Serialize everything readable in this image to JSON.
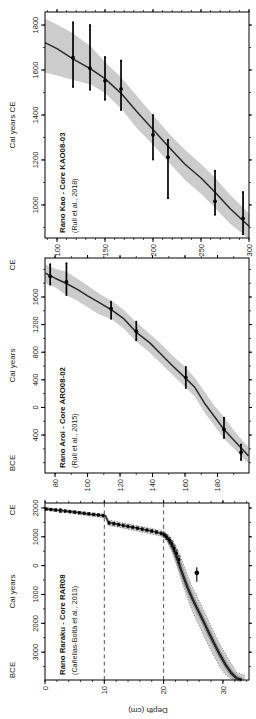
{
  "figure": {
    "depth_axis_label": "Depth (cm)",
    "background": "#ffffff",
    "text_color": "#1a1a1a",
    "frame_color": "#000000",
    "band_color": "#cccccc",
    "curve_color": "#2b2b2b",
    "fan_color": "#8c8c8c"
  },
  "chart_data": [
    {
      "id": "raraku",
      "type": "line",
      "title": "Rano Raraku - Core RAR08",
      "citation": "(Cañellas-Boltà et al., 2013)",
      "axis_title": "Cal years",
      "era_left": "BCE",
      "era_right": "CE",
      "age_range": [
        -3966,
        2172
      ],
      "age_ticks": {
        "values": [
          2000,
          1000,
          0,
          -1000,
          -2000,
          -3000
        ],
        "labels": [
          "2000",
          "1000",
          "0",
          "1000",
          "2000",
          "3000"
        ],
        "minor_step": 500
      },
      "depth_range": [
        0,
        34.4
      ],
      "depth_ticks": {
        "values": [
          0,
          10,
          20,
          30
        ],
        "labels": [
          "0",
          "10",
          "20",
          "30"
        ],
        "minor_step": 2
      },
      "dashed_depths": [
        10,
        20
      ],
      "marker": "square",
      "band_outline": "dotted",
      "band": [
        [
          0,
          1918,
          2012
        ],
        [
          2,
          1872,
          1972
        ],
        [
          4,
          1822,
          1925
        ],
        [
          6,
          1768,
          1876
        ],
        [
          8,
          1710,
          1826
        ],
        [
          10.2,
          1652,
          1782
        ],
        [
          10.7,
          1385,
          1585
        ],
        [
          12,
          1345,
          1532
        ],
        [
          14,
          1262,
          1448
        ],
        [
          16,
          1178,
          1368
        ],
        [
          18,
          1088,
          1286
        ],
        [
          19.9,
          1008,
          1192
        ],
        [
          20.5,
          872,
          1112
        ],
        [
          21,
          682,
          1022
        ],
        [
          21.5,
          452,
          882
        ],
        [
          22,
          152,
          702
        ],
        [
          22.5,
          -178,
          482
        ],
        [
          23,
          -518,
          232
        ],
        [
          23.5,
          -838,
          -38
        ],
        [
          24,
          -1128,
          -328
        ],
        [
          24.7,
          -1508,
          -678
        ],
        [
          25.5,
          -1868,
          -1018
        ],
        [
          26.4,
          -2268,
          -1398
        ],
        [
          27.4,
          -2698,
          -1838
        ],
        [
          28.4,
          -3098,
          -2278
        ],
        [
          29.4,
          -3478,
          -2678
        ],
        [
          30.4,
          -3778,
          -3048
        ],
        [
          31.4,
          -3938,
          -3398
        ],
        [
          32.3,
          -3966,
          -3698
        ],
        [
          33.6,
          -3966,
          -3790
        ]
      ],
      "curve": [
        [
          0,
          1970
        ],
        [
          1,
          1950
        ],
        [
          2,
          1928
        ],
        [
          3,
          1905
        ],
        [
          4,
          1880
        ],
        [
          5,
          1855
        ],
        [
          6,
          1828
        ],
        [
          7,
          1800
        ],
        [
          8,
          1775
        ],
        [
          9,
          1752
        ],
        [
          10.2,
          1726
        ],
        [
          10.7,
          1492
        ],
        [
          12,
          1442
        ],
        [
          13,
          1400
        ],
        [
          14,
          1360
        ],
        [
          15,
          1320
        ],
        [
          16,
          1280
        ],
        [
          17,
          1240
        ],
        [
          18,
          1196
        ],
        [
          19,
          1150
        ],
        [
          19.9,
          1100
        ],
        [
          20.5,
          1002
        ],
        [
          21,
          852
        ],
        [
          21.5,
          652
        ],
        [
          22,
          402
        ],
        [
          22.5,
          122
        ],
        [
          23,
          -178
        ],
        [
          23.5,
          -468
        ],
        [
          24,
          -738
        ],
        [
          24.7,
          -1078
        ],
        [
          25.5,
          -1420
        ],
        [
          26.4,
          -1800
        ],
        [
          27.4,
          -2230
        ],
        [
          28.4,
          -2650
        ],
        [
          29.4,
          -3050
        ],
        [
          30.4,
          -3420
        ],
        [
          31.4,
          -3720
        ],
        [
          32.3,
          -3900
        ],
        [
          33.2,
          -3960
        ]
      ],
      "dates": [
        [
          0.2,
          1963,
          1920,
          2005
        ],
        [
          1,
          1946,
          1903,
          1988
        ],
        [
          1.8,
          1928,
          1885,
          1970
        ],
        [
          2.6,
          1910,
          1840,
          1975
        ],
        [
          3.4,
          1892,
          1849,
          1934
        ],
        [
          4.2,
          1874,
          1830,
          1916
        ],
        [
          5,
          1855,
          1812,
          1898
        ],
        [
          5.8,
          1836,
          1792,
          1878
        ],
        [
          6.6,
          1816,
          1772,
          1858
        ],
        [
          7.4,
          1796,
          1752,
          1838
        ],
        [
          8.2,
          1776,
          1732,
          1818
        ],
        [
          9,
          1756,
          1712,
          1798
        ],
        [
          9.8,
          1736,
          1690,
          1780
        ],
        [
          10.8,
          1482,
          1432,
          1530
        ],
        [
          11.6,
          1452,
          1402,
          1500
        ],
        [
          12.4,
          1422,
          1372,
          1470
        ],
        [
          13.2,
          1392,
          1342,
          1440
        ],
        [
          14,
          1362,
          1312,
          1410
        ],
        [
          14.8,
          1330,
          1280,
          1378
        ],
        [
          15.6,
          1298,
          1248,
          1346
        ],
        [
          16.4,
          1266,
          1216,
          1314
        ],
        [
          17.2,
          1232,
          1182,
          1280
        ],
        [
          18,
          1198,
          1148,
          1246
        ],
        [
          18.8,
          1162,
          1110,
          1212
        ],
        [
          19.6,
          1118,
          1064,
          1170
        ],
        [
          20.1,
          1062,
          990,
          1130
        ],
        [
          20.5,
          988,
          905,
          1065
        ],
        [
          21,
          880,
          788,
          968
        ],
        [
          21.4,
          760,
          658,
          858
        ],
        [
          21.8,
          602,
          490,
          710
        ],
        [
          22.2,
          422,
          298,
          540
        ],
        [
          22.6,
          212,
          78,
          340
        ]
      ],
      "outliers": [
        [
          25.6,
          -250,
          -560,
          -60
        ]
      ],
      "fan_from_depth": 19.9
    },
    {
      "id": "aroi",
      "type": "line",
      "title": "Rano Aroi - Core ARO08-02",
      "citation": "(Rull et al., 2015)",
      "axis_title": "Cal years",
      "era_left": "BCE",
      "era_right": "CE",
      "age_range": [
        -950,
        2165
      ],
      "age_ticks": {
        "values": [
          1600,
          1200,
          800,
          400,
          0,
          -400
        ],
        "labels": [
          "1600",
          "1200",
          "800",
          "400",
          "0",
          "400"
        ],
        "minor_step": 200
      },
      "depth_range": [
        73.8,
        199.4
      ],
      "depth_ticks": {
        "values": [
          80,
          100,
          120,
          140,
          160,
          180
        ],
        "labels": [
          "80",
          "100",
          "120",
          "140",
          "160",
          "180"
        ],
        "minor_step": 10
      },
      "dashed_depths": [],
      "marker": "bar",
      "band_outline": "none",
      "band": [
        [
          74,
          1800,
          2075
        ],
        [
          80,
          1740,
          2010
        ],
        [
          87,
          1625,
          1965
        ],
        [
          94,
          1540,
          1860
        ],
        [
          100,
          1450,
          1765
        ],
        [
          107,
          1350,
          1650
        ],
        [
          115,
          1272,
          1540
        ],
        [
          122,
          1150,
          1420
        ],
        [
          130,
          955,
          1235
        ],
        [
          138,
          800,
          1070
        ],
        [
          145,
          645,
          925
        ],
        [
          152,
          480,
          760
        ],
        [
          160,
          300,
          590
        ],
        [
          166,
          160,
          430
        ],
        [
          172,
          -75,
          230
        ],
        [
          178,
          -260,
          30
        ],
        [
          184,
          -450,
          -140
        ],
        [
          190,
          -590,
          -330
        ],
        [
          196,
          -745,
          -498
        ],
        [
          199,
          -810,
          -570
        ]
      ],
      "curve": [
        [
          74,
          1945
        ],
        [
          80,
          1872
        ],
        [
          87,
          1795
        ],
        [
          94,
          1705
        ],
        [
          100,
          1618
        ],
        [
          107,
          1522
        ],
        [
          115,
          1408
        ],
        [
          122,
          1292
        ],
        [
          130,
          1088
        ],
        [
          138,
          942
        ],
        [
          145,
          778
        ],
        [
          152,
          612
        ],
        [
          160,
          432
        ],
        [
          166,
          292
        ],
        [
          172,
          62
        ],
        [
          178,
          -128
        ],
        [
          184,
          -320
        ],
        [
          190,
          -472
        ],
        [
          196,
          -622
        ],
        [
          199,
          -700
        ]
      ],
      "dates": [
        [
          77,
          1900,
          1780,
          2075
        ],
        [
          87,
          1820,
          1630,
          2090
        ],
        [
          114.5,
          1430,
          1285,
          1532
        ],
        [
          130,
          1105,
          972,
          1240
        ],
        [
          160.5,
          435,
          282,
          585
        ],
        [
          184,
          -320,
          -442,
          -148
        ],
        [
          194.5,
          -650,
          -762,
          -538
        ]
      ],
      "outliers": []
    },
    {
      "id": "kao",
      "type": "line",
      "title": "Rano Kao - Core KAO08-03",
      "citation": "(Rull et al., 2018)",
      "axis_title": "Cal years CE",
      "era_left": "",
      "era_right": "",
      "age_range": [
        853,
        1858
      ],
      "age_ticks": {
        "values": [
          1000,
          1200,
          1400,
          1600,
          1800
        ],
        "labels": [
          "1000",
          "1200",
          "1400",
          "1600",
          "1800"
        ],
        "minor_step": 100
      },
      "depth_range": [
        87.5,
        300
      ],
      "depth_ticks": {
        "values": [
          100,
          150,
          200,
          250,
          300
        ],
        "labels": [
          "100",
          "150",
          "200",
          "250",
          "300"
        ],
        "minor_step": 10
      },
      "dashed_depths": [],
      "marker": "bar",
      "band_outline": "none",
      "band": [
        [
          87.5,
          1588,
          1828
        ],
        [
          100,
          1576,
          1802
        ],
        [
          117,
          1556,
          1762
        ],
        [
          135,
          1536,
          1706
        ],
        [
          150,
          1498,
          1636
        ],
        [
          167,
          1428,
          1566
        ],
        [
          183,
          1342,
          1486
        ],
        [
          200,
          1268,
          1400
        ],
        [
          217,
          1188,
          1316
        ],
        [
          233,
          1112,
          1246
        ],
        [
          250,
          1050,
          1182
        ],
        [
          264,
          990,
          1124
        ],
        [
          280,
          918,
          1046
        ],
        [
          300,
          848,
          962
        ]
      ],
      "curve": [
        [
          87.5,
          1722
        ],
        [
          100,
          1695
        ],
        [
          117,
          1648
        ],
        [
          135,
          1605
        ],
        [
          150,
          1562
        ],
        [
          167,
          1495
        ],
        [
          183,
          1415
        ],
        [
          200,
          1335
        ],
        [
          217,
          1255
        ],
        [
          233,
          1182
        ],
        [
          250,
          1120
        ],
        [
          264,
          1060
        ],
        [
          280,
          985
        ],
        [
          300,
          905
        ]
      ],
      "dates": [
        [
          116.7,
          1655,
          1525,
          1812
        ],
        [
          134.4,
          1608,
          1512,
          1800
        ],
        [
          150,
          1552,
          1468,
          1658
        ],
        [
          166.7,
          1516,
          1422,
          1642
        ],
        [
          200,
          1312,
          1202,
          1400
        ],
        [
          215.6,
          1212,
          1030,
          1290
        ],
        [
          264.6,
          1016,
          956,
          1152
        ],
        [
          293.8,
          940,
          870,
          1058
        ]
      ],
      "outliers": []
    }
  ]
}
